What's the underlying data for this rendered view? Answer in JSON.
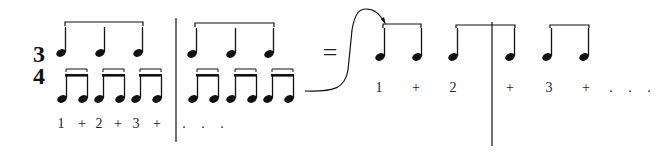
{
  "figure": {
    "time_signature": {
      "top": "3",
      "bottom": "4"
    },
    "equals_sign": "=",
    "left_counts": [
      "1",
      "+",
      "2",
      "+",
      "3",
      "+"
    ],
    "left_continuation": ". . .",
    "right_counts": [
      "1",
      "+",
      "2",
      "+",
      "3",
      "+"
    ],
    "right_continuation": ". . .",
    "colors": {
      "ink": "#111111",
      "background": "#ffffff"
    }
  }
}
